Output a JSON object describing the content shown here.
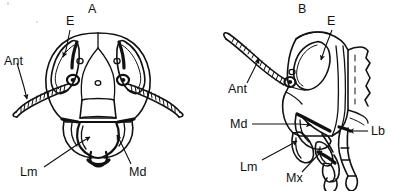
{
  "figure": {
    "kind": "scientific-line-drawing",
    "background_color": "#ffffff",
    "ink_color": "#111111",
    "panels": [
      {
        "id": "A",
        "view": "anterior (frontal) view of head",
        "labels": [
          {
            "key": "E",
            "text": "E",
            "meaning": "compound eye",
            "x": 66,
            "y": 17
          },
          {
            "key": "Ant",
            "text": "Ant",
            "meaning": "antenna",
            "x": 4,
            "y": 56
          },
          {
            "key": "Lm",
            "text": "Lm",
            "meaning": "labrum",
            "x": 20,
            "y": 168
          },
          {
            "key": "Md",
            "text": "Md",
            "meaning": "mandible",
            "x": 129,
            "y": 168
          }
        ]
      },
      {
        "id": "B",
        "view": "lateral (side) view of head",
        "labels": [
          {
            "key": "E",
            "text": "E",
            "meaning": "compound eye",
            "x": 327,
            "y": 17
          },
          {
            "key": "Ant",
            "text": "Ant",
            "meaning": "antenna",
            "x": 228,
            "y": 84
          },
          {
            "key": "Md",
            "text": "Md",
            "meaning": "mandible",
            "x": 230,
            "y": 120
          },
          {
            "key": "Lm",
            "text": "Lm",
            "meaning": "labrum",
            "x": 240,
            "y": 162
          },
          {
            "key": "Mx",
            "text": "Mx",
            "meaning": "maxilla",
            "x": 286,
            "y": 173
          },
          {
            "key": "Lb",
            "text": "Lb",
            "meaning": "labium",
            "x": 371,
            "y": 126
          }
        ]
      }
    ],
    "panel_ids": [
      {
        "text": "A",
        "x": 88,
        "y": 5
      },
      {
        "text": "B",
        "x": 298,
        "y": 5
      }
    ],
    "legend_keys": [
      {
        "abbr": "E",
        "term": "compound eye"
      },
      {
        "abbr": "Ant",
        "term": "antenna"
      },
      {
        "abbr": "Md",
        "term": "mandible"
      },
      {
        "abbr": "Lm",
        "term": "labrum"
      },
      {
        "abbr": "Mx",
        "term": "maxilla"
      },
      {
        "abbr": "Lb",
        "term": "labium"
      }
    ]
  }
}
